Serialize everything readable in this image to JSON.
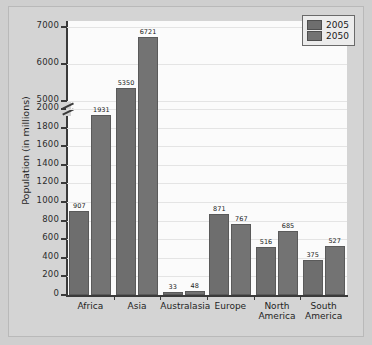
{
  "chart_data": {
    "type": "bar",
    "title": "",
    "xlabel": "",
    "ylabel": "Population (in millions)",
    "categories": [
      "Africa",
      "Asia",
      "Australasia",
      "Europe",
      "North America",
      "South America"
    ],
    "series": [
      {
        "name": "2005",
        "values": [
          907,
          5350,
          33,
          871,
          516,
          375
        ]
      },
      {
        "name": "2050",
        "values": [
          1931,
          6721,
          48,
          767,
          685,
          527
        ]
      }
    ],
    "yticks": [
      0,
      200,
      400,
      600,
      800,
      1000,
      1200,
      1400,
      1600,
      1800,
      2000,
      5000,
      6000,
      7000
    ],
    "ytick_labels": [
      "0",
      "200",
      "400",
      "600",
      "800",
      "1000",
      "1200",
      "1400",
      "1600",
      "1800",
      "2000",
      "5000",
      "6000",
      "7000"
    ],
    "ylim": [
      0,
      7000
    ],
    "axis_break": {
      "present": true,
      "between": [
        2000,
        5000
      ]
    },
    "grid": true,
    "legend": {
      "position": "top-right",
      "entries": [
        {
          "label": "2005",
          "color": "#6e6e6e"
        },
        {
          "label": "2050",
          "color": "#737373"
        }
      ]
    },
    "colors": {
      "bar_2005": "#6e6e6e",
      "bar_2050": "#737373",
      "plot_background": "#fbfbfb",
      "figure_background": "#d4d4d4",
      "axis": "#3a3a3a",
      "gridline": "#e4e4e4"
    }
  },
  "category_lines": [
    [
      "Africa"
    ],
    [
      "Asia"
    ],
    [
      "Australasia"
    ],
    [
      "Europe"
    ],
    [
      "North",
      "America"
    ],
    [
      "South",
      "America"
    ]
  ]
}
